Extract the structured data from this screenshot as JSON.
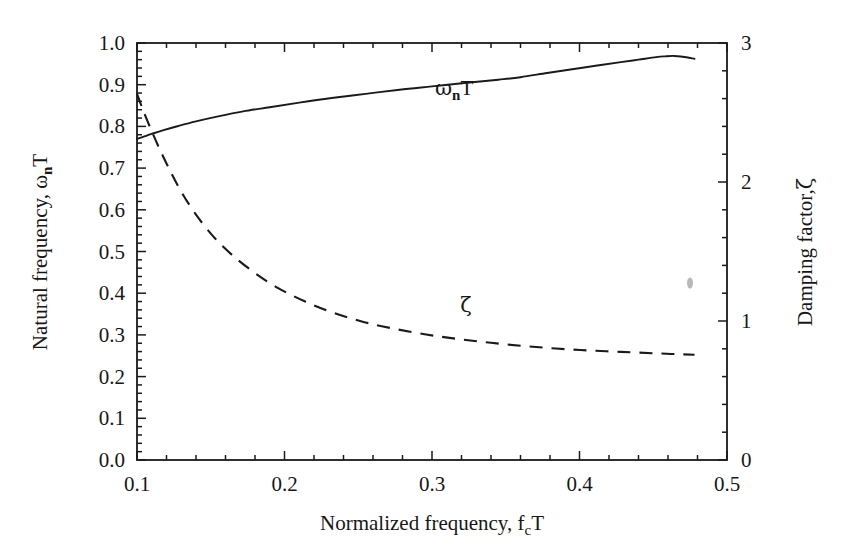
{
  "figure": {
    "background_color": "#ffffff",
    "line_color": "#1a1a1a",
    "frame": {
      "left": 137,
      "top": 43,
      "right": 727,
      "bottom": 460
    }
  },
  "chart_data": {
    "type": "line",
    "title": "",
    "xlabel": "Normalized frequency, f",
    "xlabel_sub": "c",
    "xlabel_tail": "T",
    "xlabel_full": "Normalized frequency, fcT",
    "ylabel": "Natural frequency, ω",
    "ylabel_sub": "n",
    "ylabel_tail": "T",
    "ylabel_full": "Natural frequency, ωnT",
    "y2label_full": "Damping factor,ζ",
    "y2label": "Damping factor,",
    "y2label_symbol": "ζ",
    "xlim": [
      0.1,
      0.5
    ],
    "ylim": [
      0.0,
      1.0
    ],
    "y2lim": [
      0,
      3
    ],
    "grid": false,
    "legend": "inline-annotations",
    "xticks": [
      0.1,
      0.2,
      0.3,
      0.4,
      0.5
    ],
    "xticklabels": [
      "0.1",
      "0.2",
      "0.3",
      "0.4",
      "0.5"
    ],
    "x_minor_per_major": 5,
    "yticks": [
      0.0,
      0.1,
      0.2,
      0.3,
      0.4,
      0.5,
      0.6,
      0.7,
      0.8,
      0.9,
      1.0
    ],
    "yticklabels": [
      "0.0",
      "0.1",
      "0.2",
      "0.3",
      "0.4",
      "0.5",
      "0.6",
      "0.7",
      "0.8",
      "0.9",
      "1.0"
    ],
    "y_minor_per_major": 5,
    "y2ticks": [
      0,
      1,
      2,
      3
    ],
    "y2ticklabels": [
      "0",
      "1",
      "2",
      "3"
    ],
    "y2_minor_per_major": 5,
    "series": [
      {
        "name": "ωnT",
        "label": "ω",
        "label_sub": "n",
        "label_tail": "T",
        "axis": "left",
        "style": "solid",
        "annotation_x": 0.315,
        "annotation_y": 0.875,
        "x": [
          0.1,
          0.105,
          0.11,
          0.118,
          0.128,
          0.14,
          0.155,
          0.172,
          0.19,
          0.21,
          0.232,
          0.255,
          0.278,
          0.3,
          0.322,
          0.345,
          0.36,
          0.378,
          0.395,
          0.412,
          0.428,
          0.44,
          0.452,
          0.458,
          0.464,
          0.47,
          0.478
        ],
        "y": [
          0.77,
          0.776,
          0.782,
          0.791,
          0.801,
          0.812,
          0.824,
          0.836,
          0.846,
          0.857,
          0.868,
          0.878,
          0.888,
          0.896,
          0.904,
          0.912,
          0.918,
          0.928,
          0.937,
          0.946,
          0.954,
          0.96,
          0.966,
          0.968,
          0.969,
          0.967,
          0.962
        ]
      },
      {
        "name": "ζ",
        "label": "ζ",
        "axis": "right",
        "style": "dashed",
        "annotation_x": 0.323,
        "annotation_y": 0.355,
        "x": [
          0.1,
          0.104,
          0.109,
          0.115,
          0.122,
          0.13,
          0.14,
          0.152,
          0.165,
          0.18,
          0.196,
          0.214,
          0.233,
          0.253,
          0.274,
          0.296,
          0.318,
          0.34,
          0.362,
          0.384,
          0.406,
          0.428,
          0.45,
          0.465,
          0.478
        ],
        "y2": [
          2.635,
          2.52,
          2.39,
          2.245,
          2.09,
          1.93,
          1.765,
          1.605,
          1.47,
          1.345,
          1.235,
          1.14,
          1.06,
          0.995,
          0.945,
          0.903,
          0.87,
          0.843,
          0.82,
          0.802,
          0.788,
          0.778,
          0.768,
          0.762,
          0.757
        ]
      }
    ]
  }
}
